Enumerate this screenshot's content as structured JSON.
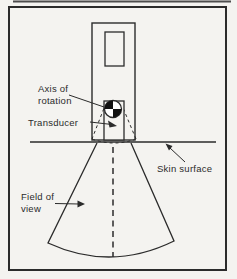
{
  "figure": {
    "type": "textbook-diagram",
    "labels": {
      "axis_of_rotation": "Axis of\nrotation",
      "transducer": "Transducer",
      "skin_surface": "Skin surface",
      "field_of_view": "Field of\nview"
    },
    "colors": {
      "paper": "#f4f3f0",
      "ink": "#2b2b2b",
      "marker_fill": "#111111"
    }
  }
}
